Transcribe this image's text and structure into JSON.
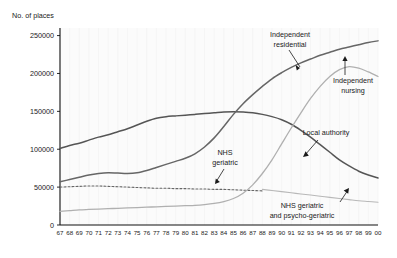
{
  "chart_data": {
    "type": "line",
    "title": "",
    "ylabel": "No. of places",
    "xlabel": "",
    "ylim": [
      0,
      260000
    ],
    "yticks": [
      0,
      50000,
      100000,
      150000,
      200000,
      250000
    ],
    "ytick_labels": [
      "0",
      "50000",
      "100000",
      "150000",
      "200000",
      "250000"
    ],
    "grid": false,
    "legend_position": "inline-annotations",
    "x": [
      "67",
      "68",
      "69",
      "70",
      "71",
      "72",
      "73",
      "74",
      "75",
      "76",
      "77",
      "78",
      "79",
      "80",
      "81",
      "82",
      "83",
      "84",
      "85",
      "86",
      "87",
      "88",
      "89",
      "90",
      "91",
      "92",
      "93",
      "94",
      "95",
      "96",
      "97",
      "98",
      "99",
      "00"
    ],
    "series": [
      {
        "name": "Local authority",
        "color": "#555555",
        "width": 1.5,
        "dash": "none",
        "values": [
          101000,
          105000,
          108000,
          112000,
          116000,
          119000,
          123000,
          127000,
          132000,
          137000,
          141000,
          143000,
          144000,
          145000,
          146000,
          147000,
          148000,
          149000,
          149500,
          149000,
          148000,
          146000,
          143000,
          139000,
          133000,
          125000,
          116000,
          106000,
          96000,
          86000,
          78000,
          71000,
          66000,
          62000
        ]
      },
      {
        "name": "Independent residential",
        "color": "#666666",
        "width": 1.5,
        "dash": "none",
        "values": [
          57000,
          60000,
          63000,
          66000,
          68000,
          69000,
          68500,
          68000,
          69000,
          72000,
          76000,
          80000,
          84000,
          88000,
          94000,
          103000,
          115000,
          130000,
          146000,
          160000,
          172000,
          183000,
          193000,
          201000,
          208000,
          214000,
          219000,
          224000,
          228000,
          232000,
          235000,
          238000,
          241000,
          243000
        ]
      },
      {
        "name": "NHS geriatric",
        "color": "#666666",
        "width": 1.1,
        "dash": "2,2",
        "values": [
          50000,
          50500,
          51000,
          51500,
          51500,
          51000,
          50500,
          50000,
          49500,
          49000,
          48500,
          48500,
          48000,
          48000,
          47500,
          47500,
          47000,
          47000,
          46500,
          46000,
          45500,
          45000,
          null,
          null,
          null,
          null,
          null,
          null,
          null,
          null,
          null,
          null,
          null,
          null
        ]
      },
      {
        "name": "Independent nursing",
        "color": "#b0b0b0",
        "width": 1.3,
        "dash": "none",
        "values": [
          18000,
          19000,
          20000,
          20500,
          21000,
          21500,
          22000,
          22500,
          23000,
          23500,
          24000,
          24500,
          25000,
          25500,
          26000,
          27000,
          28500,
          31000,
          35000,
          42000,
          53000,
          68000,
          86000,
          107000,
          128000,
          148000,
          167000,
          183000,
          196000,
          205000,
          209000,
          207000,
          202000,
          196000
        ]
      },
      {
        "name": "NHS geriatric and psycho-geriatric",
        "color": "#b8b8b8",
        "width": 1.1,
        "dash": "none",
        "values": [
          null,
          null,
          null,
          null,
          null,
          null,
          null,
          null,
          null,
          null,
          null,
          null,
          null,
          null,
          null,
          null,
          null,
          null,
          null,
          null,
          null,
          47000,
          45500,
          44000,
          42500,
          41000,
          39500,
          38000,
          36500,
          35000,
          33500,
          32000,
          31000,
          30000
        ]
      }
    ],
    "annotations": [
      {
        "name": "independent-residential",
        "label_line1": "Independent",
        "label_line2": "residential"
      },
      {
        "name": "independent-nursing",
        "label_line1": "Independent",
        "label_line2": "nursing"
      },
      {
        "name": "nhs-geriatric",
        "label_line1": "NHS",
        "label_line2": "geriatric"
      },
      {
        "name": "local-authority",
        "label_line1": "Local authority",
        "label_line2": ""
      },
      {
        "name": "nhs-geriatric-psycho",
        "label_line1": "NHS geriatric",
        "label_line2": "and psycho-geriatric"
      }
    ]
  }
}
